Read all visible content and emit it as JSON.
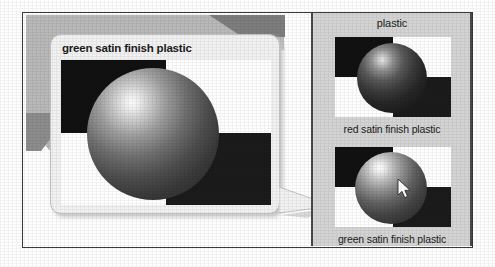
{
  "preview_callout": {
    "title": "green satin finish plastic",
    "tail_direction": "right",
    "swatch": {
      "shape": "sphere",
      "background_pattern": "checkerboard",
      "highlight_position": "upper-left"
    }
  },
  "material_panel": {
    "title": "plastic",
    "materials": [
      {
        "label": "red satin finish plastic",
        "swatch_shape": "sphere",
        "swatch_tone": "dark",
        "cursor_over": false
      },
      {
        "label": "green satin finish plastic",
        "swatch_shape": "sphere",
        "swatch_tone": "light",
        "cursor_over": true
      }
    ]
  },
  "cursor": {
    "type": "arrow-pointer",
    "over_item": "green satin finish plastic"
  },
  "colors": {
    "frame_border": "#3a3a3a",
    "panel_background": "#d4d4d4",
    "callout_background": "#f2f2f2",
    "callout_border": "#c2c2c2",
    "backdrop_gray": "#b9b9b9",
    "text": "#1d1d1d",
    "checker_dark": "#111111",
    "checker_light": "#ffffff"
  }
}
